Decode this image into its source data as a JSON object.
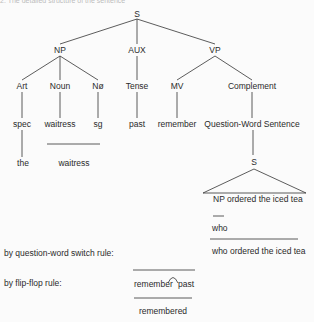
{
  "caption": "2. The detailed structure of the sentence",
  "tree": {
    "root": "S",
    "level1": {
      "np": "NP",
      "aux": "AUX",
      "vp": "VP"
    },
    "level2": {
      "art": "Art",
      "noun": "Noun",
      "nnull": "Nø",
      "tense": "Tense",
      "mv": "MV",
      "complement": "Complement"
    },
    "level3": {
      "spec": "spec",
      "waitress": "waitress",
      "sg": "sg",
      "past": "past",
      "remember": "remember",
      "qws": "Question-Word Sentence"
    },
    "level4": {
      "the": "the",
      "waitress": "waitress",
      "s": "S"
    },
    "embedded": {
      "triangle_text": "NP ordered the iced tea",
      "who": "who",
      "result": "who ordered the iced tea"
    }
  },
  "rules": {
    "question_word_switch": "by question-word switch rule:",
    "flip_flop": "by flip-flop rule:",
    "flip_flop_left": "remember",
    "flip_flop_right": "past",
    "flip_flop_result": "remembered"
  }
}
